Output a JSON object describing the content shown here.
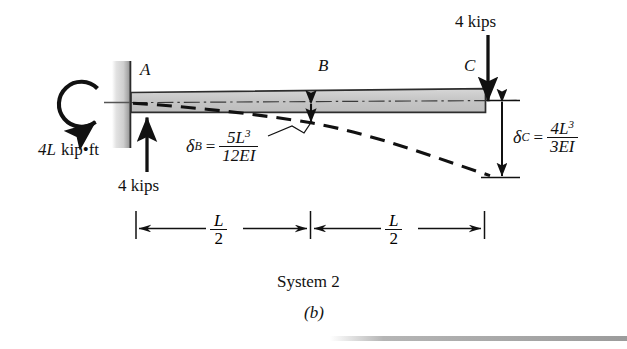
{
  "figure": {
    "caption_main": "System 2",
    "caption_sub": "(b)",
    "points": {
      "a": "A",
      "b": "B",
      "c": "C"
    },
    "loads": {
      "moment_label": "4L kip•ft",
      "moment_magnitude": "4L",
      "moment_units": "kip•ft",
      "support_reaction_label": "4 kips",
      "tip_load_label": "4 kips",
      "tip_load_value": 4,
      "tip_load_units": "kips"
    },
    "deflections": {
      "delta_b": {
        "symbol": "δ",
        "subscript": "B",
        "equals": "=",
        "numerator": "5L",
        "numerator_exp": "3",
        "denominator": "12EI"
      },
      "delta_c": {
        "symbol": "δ",
        "subscript": "C",
        "equals": "=",
        "numerator": "4L",
        "numerator_exp": "3",
        "denominator": "3EI"
      }
    },
    "dimensions": [
      {
        "num": "L",
        "den": "2"
      },
      {
        "num": "L",
        "den": "2"
      }
    ],
    "colors": {
      "ink": "#111111",
      "beam_fill": "#c9c9c9",
      "beam_edge": "#222222",
      "wall_dark": "#8f8f8f",
      "wall_light": "#e8e8e8",
      "page": "#ffffff"
    }
  }
}
